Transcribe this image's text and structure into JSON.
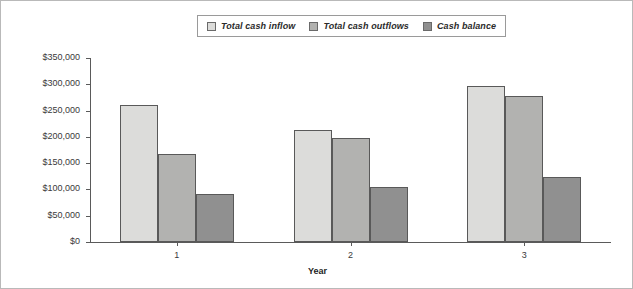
{
  "chart_data": {
    "type": "bar",
    "title": "",
    "xlabel": "Year",
    "ylabel": "",
    "categories": [
      "1",
      "2",
      "3"
    ],
    "series": [
      {
        "name": "Total cash inflow",
        "color": "#dcdcda",
        "values": [
          260000,
          213000,
          297000
        ]
      },
      {
        "name": "Total cash outflows",
        "color": "#b2b2b0",
        "values": [
          167000,
          197000,
          278000
        ]
      },
      {
        "name": "Cash balance",
        "color": "#909090",
        "values": [
          92000,
          105000,
          124000
        ]
      }
    ],
    "ylim": [
      0,
      350000
    ],
    "ytick_values": [
      0,
      50000,
      100000,
      150000,
      200000,
      250000,
      300000,
      350000
    ],
    "ytick_labels": [
      "$0",
      "$50,000",
      "$100,000",
      "$150,000",
      "$200,000",
      "$250,000",
      "$300,000",
      "$350,000"
    ],
    "grid": false,
    "legend_position": "top-center"
  },
  "legend": {
    "entries": [
      {
        "label": "Total cash inflow"
      },
      {
        "label": "Total cash outflows"
      },
      {
        "label": "Cash balance"
      }
    ]
  },
  "axes": {
    "x_title": "Year"
  }
}
